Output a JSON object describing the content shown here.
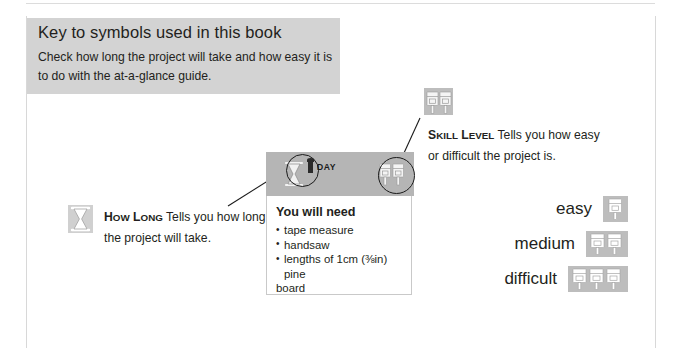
{
  "page": {
    "background_color": "#ffffff",
    "rule_color": "#dcdcdc"
  },
  "intro": {
    "title": "Key to symbols used in this book",
    "body": "Check how long the project will take and how easy it is to do with the at-a-glance guide.",
    "panel_color": "#d3d3d3"
  },
  "project_card": {
    "header": {
      "duration_number": "1",
      "duration_unit": "DAY",
      "background_color": "#b5b5b5",
      "time_icon": "hourglass-icon",
      "skill_icon": "skill-level-icon"
    },
    "heading": "You will need",
    "materials": [
      "tape measure",
      "handsaw",
      "lengths of 1cm (⅜in) pine",
      "board"
    ]
  },
  "annotations": {
    "how_long": {
      "term_cap": "H",
      "term_rest": "ow ",
      "term_cap2": "L",
      "term_rest2": "ONG",
      "label": "How LONG",
      "description": "Tells you how long the project will take.",
      "icon": "hourglass-icon"
    },
    "skill_level": {
      "label": "Skill Level",
      "description": "Tells you how easy or difficult the project is.",
      "icon": "skill-level-icon"
    }
  },
  "legend": {
    "rows": [
      {
        "label": "easy",
        "icon_count": 1,
        "icon": "skill-level-icon"
      },
      {
        "label": "medium",
        "icon_count": 2,
        "icon": "skill-level-icon"
      },
      {
        "label": "difficult",
        "icon_count": 3,
        "icon": "skill-level-icon"
      }
    ],
    "icon_background": "#bdbdbd"
  }
}
